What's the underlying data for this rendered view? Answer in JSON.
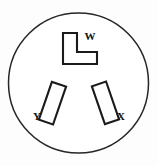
{
  "figure": {
    "name": "electrical-receptacle-face",
    "background_color": "#fdfdfd",
    "line_color": "#1a1a1a"
  },
  "body": {
    "shape": "circle",
    "center_x": 78.5,
    "center_y": 83,
    "radius": 70,
    "stroke_color": "#262626",
    "fill_color": "#ffffff"
  },
  "slots": [
    {
      "id": "slot-w",
      "label": "W",
      "shape": "l-shaped",
      "position": "top-center",
      "label_x": 90,
      "label_y": 37,
      "points": "63,33 77,33 77,52 97,52 97,64 63,64",
      "fill_color": "#fefefe",
      "stroke_color": "#1a1a1a"
    },
    {
      "id": "slot-y",
      "label": "Y",
      "shape": "rectangle",
      "position": "lower-left",
      "label_x": 37,
      "label_y": 117,
      "rect_x": 45,
      "rect_y": 83,
      "rect_width": 15,
      "rect_height": 40,
      "rotation_deg": 19,
      "rotate_origin_x": 52,
      "rotate_origin_y": 103,
      "fill_color": "#fefefe",
      "stroke_color": "#1a1a1a"
    },
    {
      "id": "slot-x",
      "label": "X",
      "shape": "rectangle",
      "position": "lower-right",
      "label_x": 121,
      "label_y": 117,
      "rect_x": 98,
      "rect_y": 83,
      "rect_width": 15,
      "rect_height": 40,
      "rotation_deg": -19,
      "rotate_origin_x": 105,
      "rotate_origin_y": 103,
      "fill_color": "#fefefe",
      "stroke_color": "#1a1a1a"
    }
  ]
}
